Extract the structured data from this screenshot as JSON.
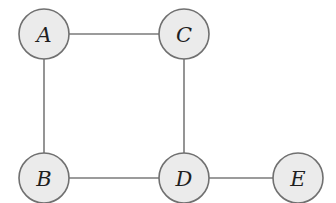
{
  "diagram": {
    "type": "undirected-graph",
    "style": {
      "node_fill": "#ebebeb",
      "node_stroke": "#707070",
      "edge_color": "#7a7a7a",
      "label_color": "#1f1f1f",
      "node_radius": 25
    },
    "nodes": [
      {
        "id": "A",
        "label": "A",
        "x": 44,
        "y": 34
      },
      {
        "id": "C",
        "label": "C",
        "x": 184,
        "y": 34
      },
      {
        "id": "B",
        "label": "B",
        "x": 44,
        "y": 178
      },
      {
        "id": "D",
        "label": "D",
        "x": 184,
        "y": 178
      },
      {
        "id": "E",
        "label": "E",
        "x": 298,
        "y": 178
      }
    ],
    "edges": [
      {
        "from": "A",
        "to": "C"
      },
      {
        "from": "A",
        "to": "B"
      },
      {
        "from": "C",
        "to": "D"
      },
      {
        "from": "B",
        "to": "D"
      },
      {
        "from": "D",
        "to": "E"
      }
    ]
  }
}
